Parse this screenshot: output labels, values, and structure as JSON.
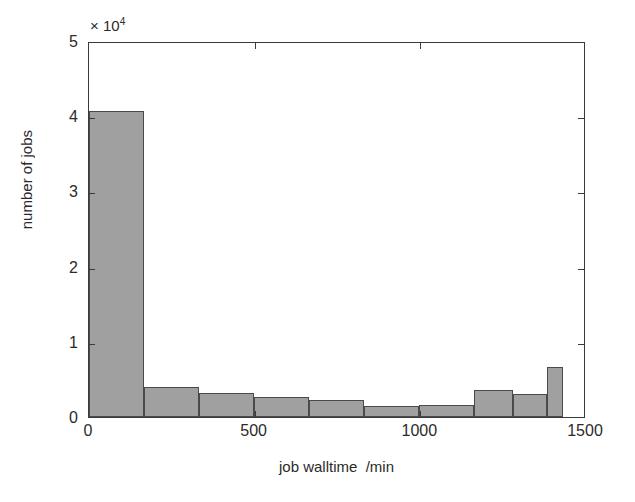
{
  "chart_data": {
    "type": "bar",
    "title": "",
    "subtitle": "",
    "xlabel": "job walltime  /min",
    "ylabel": "number of jobs",
    "y_exponent_text": "× 10",
    "y_exponent_power": "4",
    "y_scale_factor": 10000,
    "xlim": [
      0,
      1500
    ],
    "ylim": [
      0,
      50000
    ],
    "xticks": [
      0,
      500,
      1000,
      1500
    ],
    "xticklabels": [
      "0",
      "500",
      "1000",
      "1500"
    ],
    "yticks": [
      0,
      10000,
      20000,
      30000,
      40000,
      50000
    ],
    "yticklabels": [
      "0",
      "1",
      "2",
      "3",
      "4",
      "5"
    ],
    "grid": false,
    "legend": null,
    "bin_edges": [
      0,
      166,
      332,
      498,
      664,
      830,
      996,
      1162,
      1281,
      1430
    ],
    "categories": [
      "0-166",
      "166-332",
      "332-498",
      "498-664",
      "664-830",
      "830-996",
      "996-1162",
      "1162-1281",
      "1281-1430",
      "1430-1500"
    ],
    "values": [
      40700,
      4000,
      3200,
      2600,
      2200,
      1400,
      1600,
      3600,
      3000,
      6600
    ],
    "bars": [
      {
        "label": "0-166",
        "x_start": 0,
        "x_end": 166,
        "value": 40700,
        "value_scaled": 4.07
      },
      {
        "label": "166-332",
        "x_start": 166,
        "x_end": 332,
        "value": 4000,
        "value_scaled": 0.4
      },
      {
        "label": "332-498",
        "x_start": 332,
        "x_end": 498,
        "value": 3200,
        "value_scaled": 0.32
      },
      {
        "label": "498-664",
        "x_start": 498,
        "x_end": 664,
        "value": 2600,
        "value_scaled": 0.26
      },
      {
        "label": "664-830",
        "x_start": 664,
        "x_end": 830,
        "value": 2200,
        "value_scaled": 0.22
      },
      {
        "label": "830-996",
        "x_start": 830,
        "x_end": 996,
        "value": 1400,
        "value_scaled": 0.14
      },
      {
        "label": "996-1162",
        "x_start": 996,
        "x_end": 1162,
        "value": 1600,
        "value_scaled": 0.16
      },
      {
        "label": "1162-1281",
        "x_start": 1162,
        "x_end": 1281,
        "value": 3600,
        "value_scaled": 0.36
      },
      {
        "label": "1281-1381",
        "x_start": 1281,
        "x_end": 1381,
        "value": 3000,
        "value_scaled": 0.3
      },
      {
        "label": "1381-1430",
        "x_start": 1381,
        "x_end": 1430,
        "value": 6600,
        "value_scaled": 0.66
      }
    ],
    "colors": {
      "bar_fill": "#a0a0a0",
      "bar_edge": "#4a4a4a",
      "axis": "#3a3a3a",
      "text": "#2b2b2b",
      "background": "#ffffff"
    }
  }
}
